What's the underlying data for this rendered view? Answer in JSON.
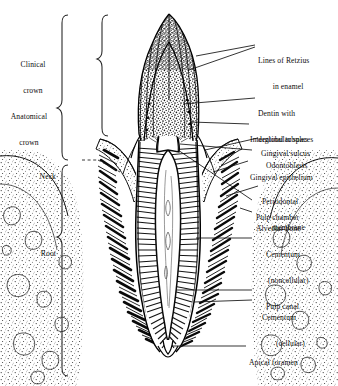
{
  "figure": {
    "ink_color": "#111111",
    "background_color": "#ffffff"
  },
  "left_labels": [
    {
      "id": "clinical-crown",
      "text": "Clinical\ncrown",
      "line1": "Clinical",
      "line2": "crown"
    },
    {
      "id": "anatomical-crown",
      "text": "Anatomical\ncrown",
      "line1": "Anatomical",
      "line2": "crown"
    },
    {
      "id": "neck",
      "text": "Neck",
      "line1": "Neck",
      "line2": ""
    },
    {
      "id": "root",
      "text": "Root",
      "line1": "Root",
      "line2": ""
    }
  ],
  "right_labels": [
    {
      "id": "lines-of-retzius",
      "line1": "Lines of Retzius",
      "line2": "in enamel"
    },
    {
      "id": "dentin",
      "line1": "Dentin with",
      "line2": "dentinal tubules"
    },
    {
      "id": "interglobular",
      "line1": "Interglobular spaces",
      "line2": ""
    },
    {
      "id": "gingival-sulcus",
      "line1": "Gingival sulcus",
      "line2": ""
    },
    {
      "id": "odontoblasts",
      "line1": "Odontoblasts",
      "line2": ""
    },
    {
      "id": "gingival-epithelium",
      "line1": "Gingival epithelium",
      "line2": ""
    },
    {
      "id": "periodontal",
      "line1": "Periodontal",
      "line2": "membrane"
    },
    {
      "id": "pulp-chamber",
      "line1": "Pulp chamber",
      "line2": ""
    },
    {
      "id": "alveolar-bone",
      "line1": "Alveolar bone",
      "line2": ""
    },
    {
      "id": "cementum-non",
      "line1": "Cementum",
      "line2": "(noncellular)"
    },
    {
      "id": "pulp-canal",
      "line1": "Pulp canal",
      "line2": ""
    },
    {
      "id": "cementum-cell",
      "line1": "Cementum",
      "line2": "(cellular)"
    },
    {
      "id": "apical-foramen",
      "line1": "Apical foramen",
      "line2": ""
    }
  ]
}
